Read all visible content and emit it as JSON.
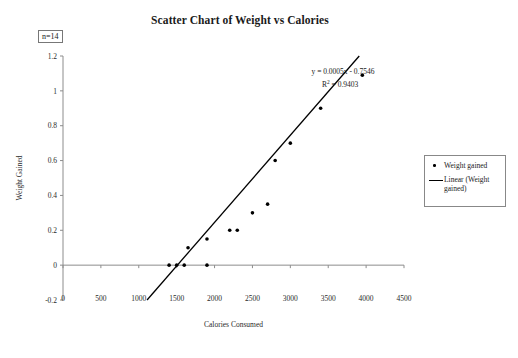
{
  "chart_data": {
    "type": "scatter",
    "title": "Scatter Chart of Weight vs Calories",
    "xlabel": "Calories Consumed",
    "ylabel": "Weight Gained",
    "xlim": [
      0,
      4500
    ],
    "ylim": [
      -0.2,
      1.2
    ],
    "xticks": [
      "0",
      "500",
      "1000",
      "1500",
      "2000",
      "2500",
      "3000",
      "3500",
      "4000",
      "4500"
    ],
    "yticks": [
      "1.2",
      "1",
      "0.8",
      "0.6",
      "0.4",
      "0.2",
      "0",
      "-0.2"
    ],
    "xtick_values": [
      0,
      500,
      1000,
      1500,
      2000,
      2500,
      3000,
      3500,
      4000,
      4500
    ],
    "ytick_values": [
      1.2,
      1,
      0.8,
      0.6,
      0.4,
      0.2,
      0,
      -0.2
    ],
    "grid": false,
    "legend_position": "right",
    "series": [
      {
        "name": "Weight gained",
        "marker": "dot",
        "color": "#000000",
        "points": [
          {
            "x": 1400,
            "y": 0
          },
          {
            "x": 1500,
            "y": 0
          },
          {
            "x": 1600,
            "y": 0
          },
          {
            "x": 1900,
            "y": 0
          },
          {
            "x": 1650,
            "y": 0.1
          },
          {
            "x": 1900,
            "y": 0.15
          },
          {
            "x": 2200,
            "y": 0.2
          },
          {
            "x": 2300,
            "y": 0.2
          },
          {
            "x": 2500,
            "y": 0.3
          },
          {
            "x": 2700,
            "y": 0.35
          },
          {
            "x": 2800,
            "y": 0.6
          },
          {
            "x": 3000,
            "y": 0.7
          },
          {
            "x": 3400,
            "y": 0.9
          },
          {
            "x": 3950,
            "y": 1.09
          }
        ]
      }
    ],
    "trendline": {
      "name": "Linear (Weight gained)",
      "equation": "y = 0.0005x - 0.7546",
      "r2_label": "R",
      "r2_sup": "2",
      "r2_value": "= 0.9403",
      "slope": 0.0005,
      "intercept": -0.7546,
      "r_squared": 0.9403,
      "color": "#000000"
    },
    "annotations": [
      {
        "name": "sample-size",
        "text": "n=14"
      }
    ]
  },
  "legend": {
    "items": [
      {
        "label": "Weight gained",
        "marker": "dot"
      },
      {
        "label": "Linear (Weight gained)",
        "marker": "line"
      }
    ]
  },
  "colors": {
    "axis": "#8c8c8c",
    "marker": "#000000",
    "trendline": "#000000",
    "text": "#1a1a1a",
    "background": "#ffffff"
  }
}
